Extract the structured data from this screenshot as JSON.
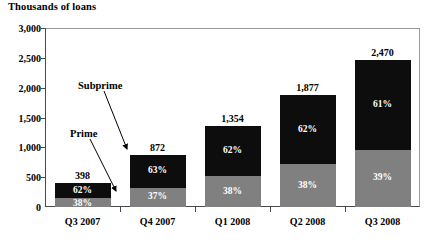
{
  "chart_data": {
    "type": "bar",
    "subtype": "stacked-bar-percent",
    "title": "Thousands of loans",
    "xlabel": "",
    "ylabel": "Thousands of loans",
    "ylim": [
      0,
      3000
    ],
    "ytick_values": [
      3000,
      2500,
      2000,
      1500,
      1000,
      500,
      0
    ],
    "ytick_labels": [
      "3,000",
      "2,500",
      "2,000",
      "1,500",
      "1,000",
      "500",
      "0"
    ],
    "grid": false,
    "legend_position": "annotations",
    "categories": [
      "Q3 2007",
      "Q4 2007",
      "Q1 2008",
      "Q2 2008",
      "Q3 2008"
    ],
    "totals": [
      398,
      872,
      1354,
      1877,
      2470
    ],
    "total_labels": [
      "398",
      "872",
      "1,354",
      "1,877",
      "2,470"
    ],
    "series": [
      {
        "name": "Subprime",
        "color": "#0d0d0d",
        "stack_order": "top",
        "percent_values": [
          62,
          63,
          62,
          62,
          61
        ],
        "percent_labels": [
          "62%",
          "63%",
          "62%",
          "62%",
          "61%"
        ]
      },
      {
        "name": "Prime",
        "color": "#808080",
        "stack_order": "bottom",
        "percent_values": [
          38,
          37,
          38,
          38,
          39
        ],
        "percent_labels": [
          "38%",
          "37%",
          "38%",
          "38%",
          "39%"
        ]
      }
    ],
    "annotations": [
      {
        "text": "Subprime",
        "label_x": 78,
        "label_y": 80,
        "arrow_x1": 104,
        "arrow_y1": 91,
        "arrow_x2": 127,
        "arrow_y2": 149
      },
      {
        "text": "Prime",
        "label_x": 70,
        "label_y": 128,
        "arrow_x1": 90,
        "arrow_y1": 139,
        "arrow_x2": 116,
        "arrow_y2": 191
      }
    ]
  }
}
